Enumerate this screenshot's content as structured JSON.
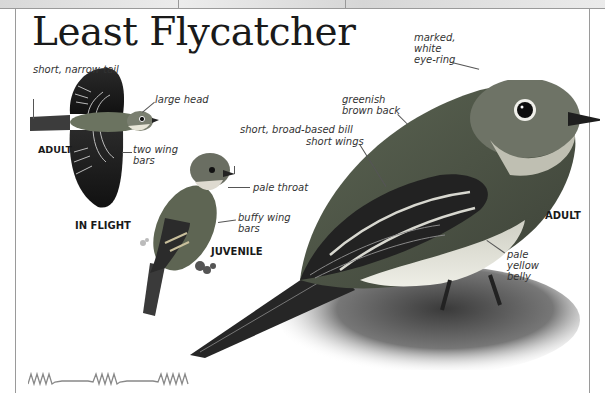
{
  "page": {
    "title": "Least Flycatcher"
  },
  "in_flight": {
    "caption": "IN FLIGHT",
    "age_label": "ADULT",
    "labels": {
      "tail": "short, narrow tail",
      "head": "large head",
      "wing_bars": "two wing bars"
    }
  },
  "juvenile": {
    "caption": "JUVENILE",
    "labels": {
      "bill": "short, broad-based bill",
      "throat": "pale throat",
      "wing_bars": "buffy wing bars"
    }
  },
  "adult": {
    "caption": "ADULT",
    "labels": {
      "eye_ring": "marked, white eye-ring",
      "back": "greenish brown back",
      "wings": "short wings",
      "belly": "pale yellow belly"
    }
  },
  "flight_pattern": {
    "icon": "undulating-flight-pattern-icon",
    "color": "#888888"
  },
  "colors": {
    "frame": "#9a9a9a",
    "title": "#1a1a1a",
    "label": "#333333"
  }
}
